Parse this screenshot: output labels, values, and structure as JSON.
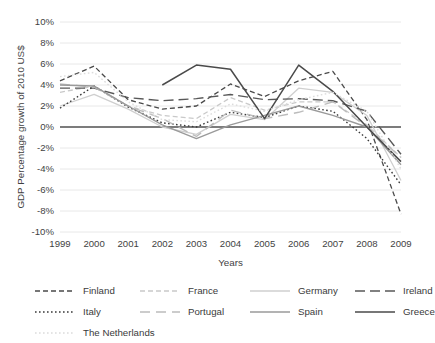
{
  "chart_data": {
    "type": "line",
    "title": "",
    "xlabel": "Years",
    "ylabel": "GDP Percentage growth of 2010 US$",
    "x": [
      1999,
      2000,
      2001,
      2002,
      2003,
      2004,
      2005,
      2006,
      2007,
      2008,
      2009
    ],
    "categories": [
      "1999",
      "2000",
      "2001",
      "2002",
      "2003",
      "2004",
      "2005",
      "2006",
      "2007",
      "2008",
      "2009"
    ],
    "ylim": [
      -10,
      10
    ],
    "yticks": [
      10,
      8,
      6,
      4,
      2,
      0,
      -2,
      -4,
      -6,
      -8,
      -10
    ],
    "ytick_labels": [
      "10%",
      "8%",
      "6%",
      "4%",
      "2%",
      "0%",
      "-2%",
      "-4%",
      "-6%",
      "-8%",
      "-10%"
    ],
    "grid": true,
    "grid_axis": "y",
    "legend_position": "bottom",
    "zero_line": 0,
    "series": [
      {
        "name": "Finland",
        "color": "#4a4a4a",
        "dash": "5,3",
        "width": 1.3,
        "values": [
          4.4,
          5.8,
          2.6,
          1.7,
          2.0,
          4.1,
          2.9,
          4.4,
          5.3,
          0.7,
          -8.3
        ]
      },
      {
        "name": "France",
        "color": "#c9c9c9",
        "dash": "5,3",
        "width": 1.3,
        "values": [
          3.3,
          3.9,
          2.0,
          1.1,
          0.8,
          2.8,
          1.6,
          2.4,
          2.4,
          0.2,
          -2.9
        ]
      },
      {
        "name": "Germany",
        "color": "#cfcfcf",
        "dash": "none",
        "width": 1.3,
        "values": [
          2.0,
          3.1,
          1.7,
          0.0,
          -0.7,
          1.2,
          0.7,
          3.7,
          3.3,
          1.1,
          -5.1
        ]
      },
      {
        "name": "Ireland",
        "color": "#585858",
        "dash": "10,5",
        "width": 1.4,
        "values": [
          3.7,
          3.7,
          2.8,
          2.5,
          2.7,
          3.1,
          2.6,
          2.7,
          2.5,
          1.5,
          -2.6
        ]
      },
      {
        "name": "Italy",
        "color": "#3a3a3a",
        "dash": "1.6,2.4",
        "width": 1.4,
        "values": [
          1.8,
          3.9,
          1.9,
          0.4,
          0.0,
          1.4,
          0.9,
          2.0,
          1.5,
          -1.1,
          -5.5
        ]
      },
      {
        "name": "Portugal",
        "color": "#bcbcbc",
        "dash": "10,6",
        "width": 1.4,
        "values": [
          4.1,
          3.8,
          2.0,
          0.8,
          -0.9,
          1.6,
          0.8,
          1.4,
          2.4,
          0.0,
          -2.9
        ]
      },
      {
        "name": "Spain",
        "color": "#9a9a9a",
        "dash": "none",
        "width": 1.4,
        "values": [
          4.0,
          3.9,
          2.0,
          0.2,
          -1.1,
          0.2,
          1.1,
          2.0,
          1.1,
          0.0,
          -3.6
        ]
      },
      {
        "name": "Greece",
        "color": "#4a4a4a",
        "dash": "none",
        "width": 1.5,
        "values": [
          null,
          null,
          null,
          4.0,
          5.9,
          5.5,
          0.8,
          5.9,
          3.4,
          0.0,
          -3.3
        ]
      },
      {
        "name": "The Netherlands",
        "color": "#dcdcdc",
        "dash": "1.6,2.4",
        "width": 1.4,
        "values": [
          4.8,
          5.2,
          2.4,
          0.7,
          0.5,
          2.2,
          1.5,
          2.6,
          3.3,
          1.5,
          -4.0
        ]
      }
    ]
  },
  "legend": {
    "rows": [
      [
        "Finland",
        "France",
        "Germany",
        "Ireland"
      ],
      [
        "Italy",
        "Portugal",
        "Spain",
        "Greece"
      ],
      [
        "The Netherlands"
      ]
    ]
  }
}
